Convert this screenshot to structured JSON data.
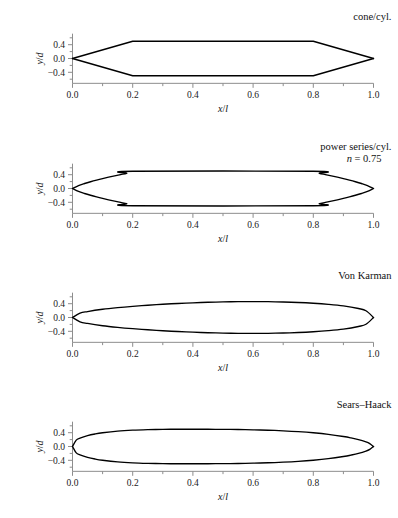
{
  "figure": {
    "cutoff_text": "",
    "panel_count": 4
  },
  "axes": {
    "xlabel": "x/l",
    "ylabel": "y/d",
    "x_ticks": [
      "0.0",
      "0.2",
      "0.4",
      "0.6",
      "0.8",
      "1.0"
    ],
    "x_tick_values": [
      0.0,
      0.2,
      0.4,
      0.6,
      0.8,
      1.0
    ],
    "x_minor_values": [
      0.1,
      0.3,
      0.5,
      0.7,
      0.9
    ],
    "y_ticks": [
      "0.4",
      "0.0",
      "−0.4"
    ],
    "y_tick_values": [
      0.4,
      0.0,
      -0.4
    ],
    "y_minor_values": [
      0.6,
      0.2,
      -0.2,
      -0.6
    ],
    "xlim": [
      0.0,
      1.0
    ],
    "ylim": [
      -0.7,
      0.7
    ],
    "grid": false,
    "spine_color": "#8d8d8d",
    "curve_color": "#000000"
  },
  "chart_data": [
    {
      "type": "line",
      "title": "cone/cyl.",
      "subtitle": "",
      "xlabel": "x/l",
      "ylabel": "y/d",
      "xlim": [
        0.0,
        1.0
      ],
      "ylim": [
        -0.7,
        0.7
      ],
      "max_radius": 0.5,
      "shoulder_x": 0.2,
      "tail_start_x": 0.8,
      "series": [
        {
          "name": "upper surface",
          "x": [
            0.0,
            0.2,
            0.8,
            1.0
          ],
          "values": [
            0.0,
            0.5,
            0.5,
            0.0
          ]
        },
        {
          "name": "lower surface",
          "x": [
            0.0,
            0.2,
            0.8,
            1.0
          ],
          "values": [
            0.0,
            -0.5,
            -0.5,
            0.0
          ]
        }
      ]
    },
    {
      "type": "line",
      "title": "power series/cyl.",
      "subtitle": "n = 0.75",
      "subtitle_symbol": "n",
      "subtitle_value": "0.75",
      "xlabel": "x/l",
      "ylabel": "y/d",
      "xlim": [
        0.0,
        1.0
      ],
      "ylim": [
        -0.7,
        0.7
      ],
      "max_radius": 0.5,
      "shoulder_x": 0.2,
      "tail_start_x": 0.8,
      "exponent_n": 0.75,
      "series": [
        {
          "name": "upper surface",
          "x": [
            0.0,
            0.02,
            0.04,
            0.06,
            0.08,
            0.1,
            0.12,
            0.14,
            0.16,
            0.18,
            0.2,
            0.8,
            0.82,
            0.84,
            0.86,
            0.88,
            0.9,
            0.92,
            0.94,
            0.96,
            0.98,
            1.0
          ],
          "values": [
            0.0,
            0.086,
            0.145,
            0.196,
            0.243,
            0.287,
            0.328,
            0.367,
            0.404,
            0.44,
            0.5,
            0.5,
            0.44,
            0.404,
            0.367,
            0.328,
            0.287,
            0.243,
            0.196,
            0.145,
            0.086,
            0.0
          ]
        },
        {
          "name": "lower surface",
          "x": [
            0.0,
            0.02,
            0.04,
            0.06,
            0.08,
            0.1,
            0.12,
            0.14,
            0.16,
            0.18,
            0.2,
            0.8,
            0.82,
            0.84,
            0.86,
            0.88,
            0.9,
            0.92,
            0.94,
            0.96,
            0.98,
            1.0
          ],
          "values": [
            0.0,
            -0.086,
            -0.145,
            -0.196,
            -0.243,
            -0.287,
            -0.328,
            -0.367,
            -0.404,
            -0.44,
            -0.5,
            -0.5,
            -0.44,
            -0.404,
            -0.367,
            -0.328,
            -0.287,
            -0.243,
            -0.196,
            -0.145,
            -0.086,
            -0.0
          ]
        }
      ]
    },
    {
      "type": "line",
      "title": "Von Karman",
      "subtitle": "",
      "xlabel": "x/l",
      "ylabel": "y/d",
      "xlim": [
        0.0,
        1.0
      ],
      "ylim": [
        -0.7,
        0.7
      ],
      "max_radius": 0.5,
      "max_radius_x": 0.5,
      "series": [
        {
          "name": "upper surface",
          "x": [
            0.0,
            0.025,
            0.05,
            0.1,
            0.15,
            0.2,
            0.25,
            0.3,
            0.35,
            0.4,
            0.45,
            0.5,
            0.55,
            0.6,
            0.65,
            0.7,
            0.75,
            0.8,
            0.85,
            0.9,
            0.95,
            0.975,
            1.0
          ],
          "values": [
            0.0,
            0.124,
            0.172,
            0.238,
            0.286,
            0.324,
            0.356,
            0.384,
            0.407,
            0.426,
            0.441,
            0.452,
            0.459,
            0.461,
            0.458,
            0.45,
            0.436,
            0.414,
            0.382,
            0.336,
            0.26,
            0.196,
            0.0
          ]
        },
        {
          "name": "lower surface",
          "x": [
            0.0,
            0.025,
            0.05,
            0.1,
            0.15,
            0.2,
            0.25,
            0.3,
            0.35,
            0.4,
            0.45,
            0.5,
            0.55,
            0.6,
            0.65,
            0.7,
            0.75,
            0.8,
            0.85,
            0.9,
            0.95,
            0.975,
            1.0
          ],
          "values": [
            0.0,
            -0.124,
            -0.172,
            -0.238,
            -0.286,
            -0.324,
            -0.356,
            -0.384,
            -0.407,
            -0.426,
            -0.441,
            -0.452,
            -0.459,
            -0.461,
            -0.458,
            -0.45,
            -0.436,
            -0.414,
            -0.382,
            -0.336,
            -0.26,
            -0.196,
            -0.0
          ]
        }
      ]
    },
    {
      "type": "line",
      "title": "Sears–Haack",
      "subtitle": "",
      "xlabel": "x/l",
      "ylabel": "y/d",
      "xlim": [
        0.0,
        1.0
      ],
      "ylim": [
        -0.7,
        0.7
      ],
      "max_radius": 0.5,
      "max_radius_x": 0.5,
      "series": [
        {
          "name": "upper surface",
          "x": [
            0.0,
            0.0125,
            0.025,
            0.05,
            0.075,
            0.1,
            0.15,
            0.2,
            0.25,
            0.3,
            0.35,
            0.4,
            0.45,
            0.5,
            0.55,
            0.6,
            0.65,
            0.7,
            0.75,
            0.8,
            0.85,
            0.9,
            0.925,
            0.95,
            0.975,
            0.9875,
            1.0
          ],
          "values": [
            0.0,
            0.186,
            0.243,
            0.315,
            0.363,
            0.398,
            0.446,
            0.473,
            0.488,
            0.496,
            0.5,
            0.5,
            0.499,
            0.497,
            0.492,
            0.484,
            0.472,
            0.455,
            0.431,
            0.398,
            0.353,
            0.29,
            0.25,
            0.201,
            0.134,
            0.085,
            0.0
          ]
        },
        {
          "name": "lower surface",
          "x": [
            0.0,
            0.0125,
            0.025,
            0.05,
            0.075,
            0.1,
            0.15,
            0.2,
            0.25,
            0.3,
            0.35,
            0.4,
            0.45,
            0.5,
            0.55,
            0.6,
            0.65,
            0.7,
            0.75,
            0.8,
            0.85,
            0.9,
            0.925,
            0.95,
            0.975,
            0.9875,
            1.0
          ],
          "values": [
            -0.0,
            -0.186,
            -0.243,
            -0.315,
            -0.363,
            -0.398,
            -0.446,
            -0.473,
            -0.488,
            -0.496,
            -0.5,
            -0.5,
            -0.499,
            -0.497,
            -0.492,
            -0.484,
            -0.472,
            -0.455,
            -0.431,
            -0.398,
            -0.353,
            -0.29,
            -0.25,
            -0.201,
            -0.134,
            -0.085,
            -0.0
          ]
        }
      ]
    }
  ]
}
